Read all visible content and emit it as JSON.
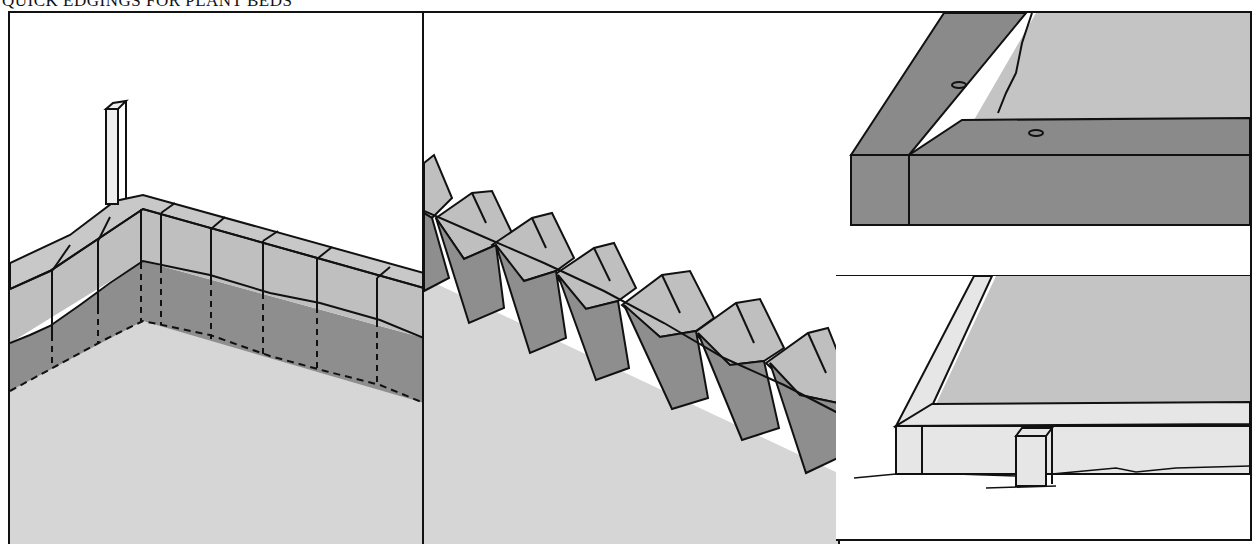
{
  "title": "QUICK EDGINGS FOR PLANT BEDS",
  "panels": [
    {
      "id": "brick-corner-edging",
      "description": "Bricks set on end along a corner edge, partially buried, with a stake at the corner"
    },
    {
      "id": "angled-brick-edging",
      "description": "Bricks set diagonally in a sawtooth row, partially buried"
    },
    {
      "id": "timber-edging-raised",
      "description": "Heavy timber boards joined at a corner with spikes, enclosing soil"
    },
    {
      "id": "board-edging-staked",
      "description": "Thin boards on edge held by a stake, enclosing soil"
    }
  ],
  "colors": {
    "ink": "#111111",
    "ground": "#d6d6d6",
    "brick_face": "#bfbfbf",
    "buried": "#8e8e8e",
    "timber": "#8a8a8a",
    "soil": "#c4c4c4",
    "board": "#e6e6e6"
  }
}
